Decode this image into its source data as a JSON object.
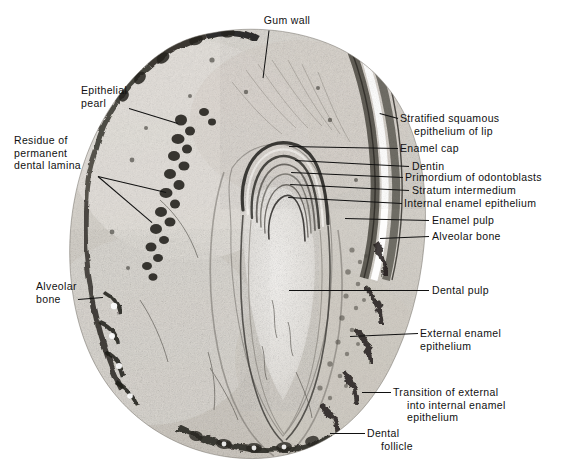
{
  "figure": {
    "kind": "histological-micrograph",
    "background_color": "#ffffff",
    "ink_color": "#111111",
    "specimen_tone_light": "#e9e7e3",
    "specimen_tone_mid": "#b9b5ae",
    "specimen_tone_dark": "#4a4844",
    "specimen_tone_darkest": "#23211f"
  },
  "labels": [
    {
      "id": "gum-wall",
      "name": "gum-wall",
      "lines": [
        "Gum wall"
      ],
      "side": "top",
      "text_x": 242,
      "text_y": 14,
      "text_w": 90,
      "align": "center",
      "leader": [
        {
          "x1": 269,
          "y1": 30,
          "x2": 263,
          "y2": 78
        }
      ]
    },
    {
      "id": "epithelial-pearl",
      "name": "epithelial-pearl",
      "lines": [
        "Epithelial",
        "pearl"
      ],
      "side": "left",
      "text_x": 81,
      "text_y": 84,
      "text_w": 80,
      "align": "left",
      "leader": [
        {
          "x1": 129,
          "y1": 108,
          "x2": 178,
          "y2": 123
        }
      ]
    },
    {
      "id": "residue-of-permanent-dental-lamina",
      "name": "residue-of-permanent-dental-lamina",
      "lines": [
        "Residue of",
        "permanent",
        "dental lamina"
      ],
      "side": "left",
      "text_x": 14,
      "text_y": 134,
      "text_w": 105,
      "align": "left",
      "leader": [
        {
          "x1": 98,
          "y1": 176,
          "x2": 166,
          "y2": 192
        },
        {
          "x1": 98,
          "y1": 176,
          "x2": 152,
          "y2": 222
        }
      ]
    },
    {
      "id": "stratified-squamous-epithelium-of-lip",
      "name": "stratified-squamous-epithelium-of-lip",
      "lines": [
        "Stratified squamous",
        "epithelium of lip"
      ],
      "indent": [
        0,
        1
      ],
      "side": "right",
      "text_x": 400,
      "text_y": 112,
      "text_w": 170,
      "align": "left",
      "leader": [
        {
          "x1": 398,
          "y1": 118,
          "x2": 380,
          "y2": 113
        }
      ]
    },
    {
      "id": "enamel-cap",
      "name": "enamel-cap",
      "lines": [
        "Enamel cap"
      ],
      "side": "right",
      "text_x": 400,
      "text_y": 142,
      "text_w": 170,
      "align": "left",
      "leader": [
        {
          "x1": 398,
          "y1": 148,
          "x2": 289,
          "y2": 146
        }
      ]
    },
    {
      "id": "dentin",
      "name": "dentin",
      "lines": [
        "Dentin"
      ],
      "side": "right",
      "text_x": 412,
      "text_y": 160,
      "text_w": 160,
      "align": "left",
      "leader": [
        {
          "x1": 409,
          "y1": 166,
          "x2": 295,
          "y2": 160
        }
      ]
    },
    {
      "id": "primordium-of-odontoblasts",
      "name": "primordium-of-odontoblasts",
      "lines": [
        "Primordium of odontoblasts"
      ],
      "side": "right",
      "text_x": 405,
      "text_y": 171,
      "text_w": 165,
      "align": "left",
      "leader": [
        {
          "x1": 403,
          "y1": 177,
          "x2": 291,
          "y2": 172
        }
      ]
    },
    {
      "id": "stratum-intermedium",
      "name": "stratum-intermedium",
      "lines": [
        "Stratum intermedium"
      ],
      "side": "right",
      "text_x": 412,
      "text_y": 184,
      "text_w": 160,
      "align": "left",
      "leader": [
        {
          "x1": 409,
          "y1": 190,
          "x2": 290,
          "y2": 184
        }
      ]
    },
    {
      "id": "internal-enamel-epithelium",
      "name": "internal-enamel-epithelium",
      "lines": [
        "Internal enamel epithelium"
      ],
      "side": "right",
      "text_x": 404,
      "text_y": 197,
      "text_w": 168,
      "align": "left",
      "leader": [
        {
          "x1": 402,
          "y1": 203,
          "x2": 288,
          "y2": 197
        }
      ]
    },
    {
      "id": "enamel-pulp",
      "name": "enamel-pulp",
      "lines": [
        "Enamel pulp"
      ],
      "side": "right",
      "text_x": 432,
      "text_y": 214,
      "text_w": 140,
      "align": "left",
      "leader": [
        {
          "x1": 429,
          "y1": 220,
          "x2": 345,
          "y2": 218
        }
      ]
    },
    {
      "id": "alveolar-bone-right",
      "name": "alveolar-bone-right",
      "lines": [
        "Alveolar bone"
      ],
      "side": "right",
      "text_x": 432,
      "text_y": 230,
      "text_w": 140,
      "align": "left",
      "leader": [
        {
          "x1": 429,
          "y1": 236,
          "x2": 380,
          "y2": 238
        }
      ]
    },
    {
      "id": "alveolar-bone-left",
      "name": "alveolar-bone-left",
      "lines": [
        "Alveolar",
        "bone"
      ],
      "side": "left",
      "text_x": 36,
      "text_y": 280,
      "text_w": 80,
      "align": "left",
      "leader": [
        {
          "x1": 78,
          "y1": 299,
          "x2": 103,
          "y2": 297
        }
      ]
    },
    {
      "id": "dental-pulp",
      "name": "dental-pulp",
      "lines": [
        "Dental pulp"
      ],
      "side": "right",
      "text_x": 432,
      "text_y": 284,
      "text_w": 140,
      "align": "left",
      "leader": [
        {
          "x1": 429,
          "y1": 290,
          "x2": 289,
          "y2": 290
        }
      ]
    },
    {
      "id": "external-enamel-epithelium",
      "name": "external-enamel-epithelium",
      "lines": [
        "External enamel",
        "epithelium"
      ],
      "side": "right",
      "text_x": 420,
      "text_y": 327,
      "text_w": 150,
      "align": "left",
      "leader": [
        {
          "x1": 418,
          "y1": 333,
          "x2": 350,
          "y2": 336
        }
      ]
    },
    {
      "id": "transition-of-external-into-internal-enamel-epithelium",
      "name": "transition-of-external-into-internal-enamel-epithelium",
      "lines": [
        "Transition of external",
        "into internal enamel",
        "epithelium"
      ],
      "indent": [
        0,
        1,
        1
      ],
      "side": "right",
      "text_x": 393,
      "text_y": 386,
      "text_w": 178,
      "align": "left",
      "leader": [
        {
          "x1": 391,
          "y1": 392,
          "x2": 362,
          "y2": 392
        }
      ]
    },
    {
      "id": "dental-follicle",
      "name": "dental-follicle",
      "lines": [
        "Dental",
        "follicle"
      ],
      "indent": [
        0,
        1
      ],
      "side": "right",
      "text_x": 367,
      "text_y": 427,
      "text_w": 120,
      "align": "left",
      "leader": [
        {
          "x1": 365,
          "y1": 433,
          "x2": 330,
          "y2": 433
        }
      ]
    }
  ]
}
